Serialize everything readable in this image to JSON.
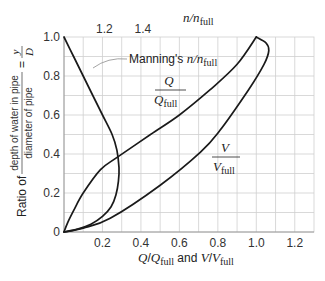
{
  "chart_data": {
    "type": "line",
    "title": "",
    "xlabel": "Q/Q_full and V/V_full",
    "xlabel_parts": {
      "q": "Q",
      "qsub": "full",
      "and": " and ",
      "v": "V",
      "vsub": "full",
      "slash": "/"
    },
    "ylabel": "Ratio of depth of water in pipe / diameter of pipe = y / D",
    "ylabel_parts": {
      "prefix": "Ratio of",
      "num": "depth of water in pipe",
      "den": "diameter of pipe",
      "eq": "=",
      "y": "y",
      "d": "D"
    },
    "top_axis_label": "n/n_full",
    "top_axis_parts": {
      "n": "n/n",
      "sub": "full"
    },
    "xlim": [
      0,
      1.3
    ],
    "ylim": [
      0,
      1.0
    ],
    "x_ticks": [
      "0.2",
      "0.4",
      "0.6",
      "0.8",
      "1.0",
      "1.2"
    ],
    "x_tick_values": [
      0.2,
      0.4,
      0.6,
      0.8,
      1.0,
      1.2
    ],
    "y_ticks": [
      "0",
      "0.2",
      "0.4",
      "0.6",
      "0.8",
      "1.0"
    ],
    "y_tick_values": [
      0,
      0.2,
      0.4,
      0.6,
      0.8,
      1.0
    ],
    "top_ticks": [
      "1.2",
      "1.4"
    ],
    "top_tick_values": [
      1.2,
      1.4
    ],
    "grid": true,
    "grid_step": 0.1,
    "legend": "inline labels",
    "series": [
      {
        "name": "Manning's n/n_full",
        "axis": "top",
        "x": [
          1.0,
          1.05,
          1.1,
          1.15,
          1.2,
          1.25,
          1.275,
          1.286,
          1.283,
          1.27,
          1.245,
          1.2,
          1.14,
          1.07,
          1.0
        ],
        "y": [
          1.0,
          0.9,
          0.8,
          0.7,
          0.6,
          0.5,
          0.42,
          0.33,
          0.26,
          0.19,
          0.13,
          0.08,
          0.04,
          0.015,
          0.0
        ]
      },
      {
        "name": "Q/Q_full",
        "axis": "bottom",
        "x": [
          0.0,
          0.02,
          0.05,
          0.1,
          0.19,
          0.28,
          0.45,
          0.6,
          0.76,
          0.9,
          1.0
        ],
        "y": [
          0.0,
          0.05,
          0.11,
          0.2,
          0.32,
          0.385,
          0.5,
          0.6,
          0.73,
          0.86,
          1.0
        ]
      },
      {
        "name": "V/V_full",
        "axis": "bottom",
        "x": [
          0.0,
          0.1,
          0.24,
          0.5,
          0.71,
          0.81,
          0.96,
          1.04,
          1.065,
          1.05,
          1.0
        ],
        "y": [
          0.0,
          0.02,
          0.07,
          0.24,
          0.41,
          0.52,
          0.73,
          0.86,
          0.93,
          0.97,
          1.0
        ]
      }
    ],
    "annotations": [
      {
        "text": "Manning's n/n_full",
        "parts": {
          "main": "Manning's ",
          "n": "n/n",
          "sub": "full"
        }
      },
      {
        "text": "Q/Q_full",
        "parts": {
          "num": "Q",
          "den": "Q",
          "sub": "full"
        }
      },
      {
        "text": "V/V_full",
        "parts": {
          "num": "V",
          "den": "V",
          "sub": "full"
        }
      }
    ]
  }
}
